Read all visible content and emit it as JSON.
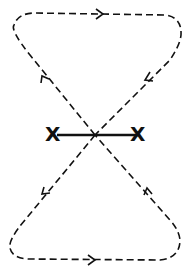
{
  "diagram": {
    "markers": [
      {
        "label": "X",
        "x": 54,
        "y": 135
      },
      {
        "label": "X",
        "x": 137,
        "y": 135
      }
    ],
    "colors": {
      "stroke": "#111111",
      "background": "#ffffff"
    },
    "arrows": [
      {
        "location": "top-edge",
        "direction": "right"
      },
      {
        "location": "upper-right-diagonal",
        "direction": "down-left"
      },
      {
        "location": "upper-left-diagonal",
        "direction": "up-left"
      },
      {
        "location": "lower-left-diagonal",
        "direction": "down-left"
      },
      {
        "location": "lower-right-diagonal",
        "direction": "up-right"
      },
      {
        "location": "bottom-edge",
        "direction": "right"
      }
    ]
  }
}
